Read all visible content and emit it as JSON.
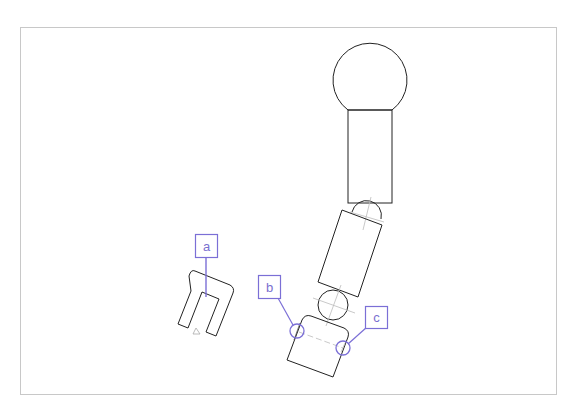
{
  "figure": {
    "frame": {
      "x": 20,
      "y": 27,
      "w": 536,
      "h": 367,
      "color": "#c8c8c8"
    },
    "colors": {
      "outline": "#222222",
      "callout": "#7b6fd6",
      "guide": "#bbbbbb"
    },
    "callouts": [
      {
        "label": "a",
        "box": {
          "x": 195,
          "y": 234,
          "w": 22,
          "h": 23
        },
        "target": {
          "x": 206,
          "y": 297
        },
        "circle": false
      },
      {
        "label": "b",
        "box": {
          "x": 258,
          "y": 275,
          "w": 22,
          "h": 23
        },
        "target": {
          "x": 297,
          "y": 331
        },
        "circle": true
      },
      {
        "label": "c",
        "box": {
          "x": 365,
          "y": 306,
          "w": 22,
          "h": 22
        },
        "target": {
          "x": 343,
          "y": 348
        },
        "circle": true
      }
    ],
    "parts": {
      "head": "ball-head",
      "upper_arm": "upper-arm-segment",
      "elbow_joint": "elbow-joint",
      "forearm": "forearm-segment",
      "wrist_joint": "wrist-joint",
      "hand": "hand-block",
      "gripper": "u-shaped-gripper",
      "marker": "triangle-marker"
    }
  }
}
